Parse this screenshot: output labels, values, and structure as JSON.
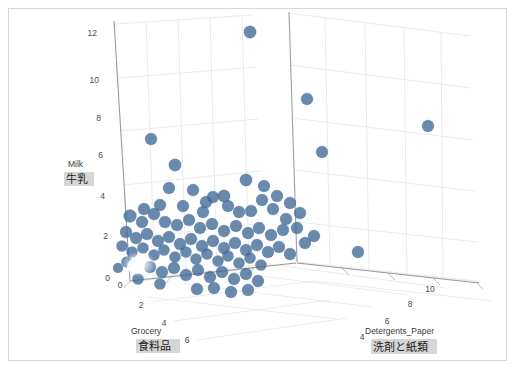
{
  "figure": {
    "background": "#ffffff",
    "border_color": "#d8d8d8",
    "marker_color": "#3f6896",
    "marker_opacity": 0.78,
    "grid_color": "#e9e9e9",
    "axis_line_color": "#9a9a9a",
    "highlight_color": "#d6d6d6"
  },
  "axes": {
    "z": {
      "name_en": "Milk",
      "name_jp": "牛乳",
      "ticks": [
        "0",
        "2",
        "4",
        "6",
        "8",
        "10",
        "12"
      ],
      "range": [
        0,
        13
      ]
    },
    "x": {
      "name_en": "Grocery",
      "name_jp": "食料品",
      "ticks": [
        "0",
        "2",
        "4",
        "6"
      ],
      "range": [
        0,
        7
      ]
    },
    "y": {
      "name_en": "Detergents_Paper",
      "name_jp": "洗剤と紙類",
      "ticks": [
        "4",
        "6",
        "8",
        "10"
      ],
      "range": [
        3,
        11
      ]
    }
  },
  "chart_data": {
    "type": "scatter",
    "title": "",
    "xlabel": "Grocery",
    "ylabel": "Detergents_Paper",
    "zlabel": "Milk",
    "grid": true,
    "legend": null,
    "xlim": [
      0,
      7
    ],
    "ylim": [
      3,
      11
    ],
    "zlim": [
      0,
      13
    ],
    "projected_points": [
      {
        "px": 250,
        "py": 32,
        "r": 6.2
      },
      {
        "px": 307,
        "py": 99,
        "r": 6.0
      },
      {
        "px": 428,
        "py": 126,
        "r": 6.0
      },
      {
        "px": 322,
        "py": 152,
        "r": 6.0
      },
      {
        "px": 151,
        "py": 139,
        "r": 6.0
      },
      {
        "px": 175,
        "py": 165,
        "r": 6.2
      },
      {
        "px": 193,
        "py": 190,
        "r": 6.0
      },
      {
        "px": 246,
        "py": 180,
        "r": 6.2
      },
      {
        "px": 264,
        "py": 186,
        "r": 6.0
      },
      {
        "px": 290,
        "py": 203,
        "r": 6.0
      },
      {
        "px": 358,
        "py": 252,
        "r": 6.0
      },
      {
        "px": 169,
        "py": 188,
        "r": 6.0
      },
      {
        "px": 213,
        "py": 197,
        "r": 6.0
      },
      {
        "px": 224,
        "py": 196,
        "r": 6.2
      },
      {
        "px": 203,
        "py": 212,
        "r": 6.0
      },
      {
        "px": 239,
        "py": 212,
        "r": 6.0
      },
      {
        "px": 251,
        "py": 211,
        "r": 6.0
      },
      {
        "px": 273,
        "py": 209,
        "r": 6.0
      },
      {
        "px": 130,
        "py": 216,
        "r": 6.4
      },
      {
        "px": 142,
        "py": 222,
        "r": 6.0
      },
      {
        "px": 154,
        "py": 214,
        "r": 6.0
      },
      {
        "px": 165,
        "py": 222,
        "r": 6.0
      },
      {
        "px": 177,
        "py": 225,
        "r": 6.0
      },
      {
        "px": 189,
        "py": 220,
        "r": 6.0
      },
      {
        "px": 200,
        "py": 228,
        "r": 6.0
      },
      {
        "px": 212,
        "py": 224,
        "r": 6.0
      },
      {
        "px": 224,
        "py": 231,
        "r": 6.0
      },
      {
        "px": 236,
        "py": 226,
        "r": 6.0
      },
      {
        "px": 248,
        "py": 233,
        "r": 6.0
      },
      {
        "px": 259,
        "py": 228,
        "r": 6.0
      },
      {
        "px": 271,
        "py": 235,
        "r": 6.0
      },
      {
        "px": 283,
        "py": 230,
        "r": 6.0
      },
      {
        "px": 126,
        "py": 232,
        "r": 6.0
      },
      {
        "px": 136,
        "py": 238,
        "r": 6.0
      },
      {
        "px": 147,
        "py": 234,
        "r": 6.0
      },
      {
        "px": 158,
        "py": 241,
        "r": 6.0
      },
      {
        "px": 169,
        "py": 237,
        "r": 6.0
      },
      {
        "px": 180,
        "py": 244,
        "r": 6.0
      },
      {
        "px": 191,
        "py": 239,
        "r": 6.0
      },
      {
        "px": 202,
        "py": 246,
        "r": 6.0
      },
      {
        "px": 213,
        "py": 241,
        "r": 6.0
      },
      {
        "px": 224,
        "py": 248,
        "r": 6.0
      },
      {
        "px": 235,
        "py": 243,
        "r": 6.0
      },
      {
        "px": 246,
        "py": 250,
        "r": 6.0
      },
      {
        "px": 257,
        "py": 245,
        "r": 6.0
      },
      {
        "px": 268,
        "py": 252,
        "r": 6.0
      },
      {
        "px": 279,
        "py": 247,
        "r": 6.0
      },
      {
        "px": 290,
        "py": 254,
        "r": 6.0
      },
      {
        "px": 122,
        "py": 246,
        "r": 5.6
      },
      {
        "px": 132,
        "py": 252,
        "r": 5.6
      },
      {
        "px": 143,
        "py": 248,
        "r": 5.6
      },
      {
        "px": 154,
        "py": 255,
        "r": 5.6
      },
      {
        "px": 164,
        "py": 250,
        "r": 5.6
      },
      {
        "px": 175,
        "py": 257,
        "r": 5.6
      },
      {
        "px": 186,
        "py": 252,
        "r": 5.6
      },
      {
        "px": 196,
        "py": 259,
        "r": 5.6
      },
      {
        "px": 207,
        "py": 254,
        "r": 5.6
      },
      {
        "px": 218,
        "py": 261,
        "r": 5.6
      },
      {
        "px": 228,
        "py": 256,
        "r": 5.6
      },
      {
        "px": 239,
        "py": 263,
        "r": 5.6
      },
      {
        "px": 250,
        "py": 258,
        "r": 5.6
      },
      {
        "px": 261,
        "py": 265,
        "r": 5.6
      },
      {
        "px": 150,
        "py": 267,
        "r": 6.0
      },
      {
        "px": 162,
        "py": 272,
        "r": 6.0
      },
      {
        "px": 174,
        "py": 268,
        "r": 6.0
      },
      {
        "px": 186,
        "py": 275,
        "r": 6.0
      },
      {
        "px": 198,
        "py": 270,
        "r": 6.0
      },
      {
        "px": 210,
        "py": 277,
        "r": 6.0
      },
      {
        "px": 222,
        "py": 272,
        "r": 6.0
      },
      {
        "px": 234,
        "py": 279,
        "r": 6.0
      },
      {
        "px": 246,
        "py": 274,
        "r": 6.0
      },
      {
        "px": 258,
        "py": 281,
        "r": 6.0
      },
      {
        "px": 197,
        "py": 289,
        "r": 6.0
      },
      {
        "px": 214,
        "py": 288,
        "r": 6.0
      },
      {
        "px": 231,
        "py": 292,
        "r": 6.0
      },
      {
        "px": 248,
        "py": 290,
        "r": 6.0
      },
      {
        "px": 160,
        "py": 284,
        "r": 5.6
      },
      {
        "px": 138,
        "py": 279,
        "r": 5.6
      },
      {
        "px": 127,
        "py": 262,
        "r": 5.6
      },
      {
        "px": 118,
        "py": 268,
        "r": 5.0
      },
      {
        "px": 305,
        "py": 243,
        "r": 6.0
      },
      {
        "px": 314,
        "py": 236,
        "r": 6.0
      },
      {
        "px": 297,
        "py": 228,
        "r": 6.0
      },
      {
        "px": 286,
        "py": 219,
        "r": 6.0
      },
      {
        "px": 300,
        "py": 213,
        "r": 6.0
      },
      {
        "px": 277,
        "py": 196,
        "r": 6.0
      },
      {
        "px": 262,
        "py": 200,
        "r": 6.0
      },
      {
        "px": 228,
        "py": 206,
        "r": 6.0
      },
      {
        "px": 206,
        "py": 202,
        "r": 6.0
      },
      {
        "px": 183,
        "py": 206,
        "r": 6.0
      },
      {
        "px": 160,
        "py": 205,
        "r": 6.0
      },
      {
        "px": 144,
        "py": 209,
        "r": 6.0
      }
    ]
  }
}
